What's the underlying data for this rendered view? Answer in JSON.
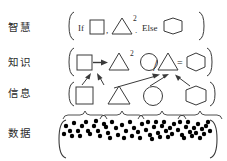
{
  "diagram": {
    "stroke_color": "#3a3a3a",
    "dot_color": "#000000",
    "background": "#ffffff",
    "rows": [
      {
        "id": "wisdom",
        "label": "智慧",
        "bracket_left": "[",
        "bracket_right": "]",
        "tokens": [
          {
            "type": "text",
            "value": "If"
          },
          {
            "type": "shape",
            "value": "square"
          },
          {
            "type": "text",
            "value": ","
          },
          {
            "type": "shape",
            "value": "triangle"
          },
          {
            "type": "text",
            "value": "2"
          },
          {
            "type": "text",
            "value": "."
          },
          {
            "type": "text",
            "value": "Else"
          },
          {
            "type": "shape",
            "value": "hexagon"
          }
        ]
      },
      {
        "id": "knowledge",
        "label": "知识",
        "bracket_left": "[",
        "bracket_right": "]",
        "tokens": [
          {
            "type": "shape",
            "value": "square"
          },
          {
            "type": "text",
            "value": "→"
          },
          {
            "type": "shape",
            "value": "triangle"
          },
          {
            "type": "text",
            "value": "2"
          },
          {
            "type": "shape",
            "value": "circle"
          },
          {
            "type": "text",
            "value": "/"
          },
          {
            "type": "shape",
            "value": "triangle"
          },
          {
            "type": "text",
            "value": "="
          },
          {
            "type": "shape",
            "value": "hexagon"
          }
        ]
      },
      {
        "id": "information",
        "label": "信息",
        "bracket_left": "[",
        "bracket_right": "]",
        "tokens": [
          {
            "type": "shape",
            "value": "square"
          },
          {
            "type": "shape",
            "value": "triangle"
          },
          {
            "type": "shape",
            "value": "circle"
          },
          {
            "type": "shape",
            "value": "hexagon"
          }
        ]
      },
      {
        "id": "data",
        "label": "数据",
        "bracket_left": "[",
        "bracket_right": "]",
        "group_count": 4
      }
    ],
    "arrows": [
      {
        "from": "information-square",
        "to": "knowledge-square"
      },
      {
        "from": "information-triangle",
        "to": "knowledge-square"
      },
      {
        "from": "information-triangle",
        "to": "knowledge-triangle"
      },
      {
        "from": "information-circle",
        "to": "knowledge-triangle"
      },
      {
        "from": "information-hexagon",
        "to": "knowledge-triangle"
      }
    ],
    "data_dots": [
      [
        66,
        126
      ],
      [
        74,
        123
      ],
      [
        82,
        126
      ],
      [
        70,
        131
      ],
      [
        78,
        131
      ],
      [
        64,
        134
      ],
      [
        72,
        136
      ],
      [
        80,
        136
      ],
      [
        88,
        131
      ],
      [
        86,
        122
      ],
      [
        94,
        126
      ],
      [
        90,
        134
      ],
      [
        98,
        131
      ],
      [
        96,
        121
      ],
      [
        104,
        124
      ],
      [
        100,
        136
      ],
      [
        108,
        133
      ],
      [
        106,
        127
      ],
      [
        112,
        122
      ],
      [
        116,
        128
      ],
      [
        110,
        138
      ],
      [
        118,
        135
      ],
      [
        122,
        125
      ],
      [
        126,
        131
      ],
      [
        124,
        138
      ],
      [
        130,
        122
      ],
      [
        134,
        128
      ],
      [
        132,
        136
      ],
      [
        138,
        132
      ],
      [
        142,
        124
      ],
      [
        140,
        138
      ],
      [
        146,
        130
      ],
      [
        150,
        135
      ],
      [
        148,
        122
      ],
      [
        154,
        127
      ],
      [
        152,
        139
      ],
      [
        158,
        133
      ],
      [
        156,
        122
      ],
      [
        162,
        126
      ],
      [
        160,
        137
      ],
      [
        166,
        131
      ],
      [
        164,
        122
      ],
      [
        170,
        128
      ],
      [
        168,
        137
      ],
      [
        174,
        124
      ],
      [
        172,
        134
      ],
      [
        178,
        130
      ],
      [
        182,
        135
      ],
      [
        180,
        122
      ],
      [
        186,
        127
      ],
      [
        184,
        138
      ],
      [
        190,
        132
      ],
      [
        188,
        122
      ],
      [
        194,
        128
      ],
      [
        192,
        136
      ],
      [
        198,
        124
      ],
      [
        196,
        133
      ],
      [
        202,
        129
      ],
      [
        200,
        138
      ],
      [
        206,
        126
      ],
      [
        204,
        134
      ],
      [
        210,
        131
      ],
      [
        208,
        122
      ]
    ],
    "data_braces": [
      {
        "x1": 63,
        "x2": 98
      },
      {
        "x1": 100,
        "x2": 134
      },
      {
        "x1": 136,
        "x2": 174
      },
      {
        "x1": 176,
        "x2": 214
      }
    ]
  }
}
